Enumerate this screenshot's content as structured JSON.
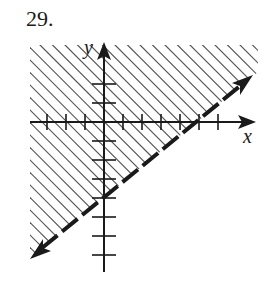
{
  "problem": {
    "number_label": "29."
  },
  "axes": {
    "x_label": "x",
    "y_label": "y",
    "unit_px": 19,
    "origin_px": [
      104,
      122
    ],
    "x_ticks": [
      -3,
      -2,
      -1,
      1,
      2,
      3,
      4,
      5,
      6
    ],
    "y_ticks": [
      2,
      1,
      -1,
      -2,
      -3,
      -4,
      -5,
      -6,
      -7
    ]
  },
  "inequality": {
    "boundary": "y = 0.8x - 4",
    "slope": 0.8,
    "y_intercept": -4,
    "x_intercept": 5,
    "boundary_style": "dashed",
    "shaded_side": "above",
    "description": "4x - 5y < 20"
  },
  "colors": {
    "ink": "#1a1a1a",
    "hatch": "#555555",
    "background": "#ffffff"
  }
}
